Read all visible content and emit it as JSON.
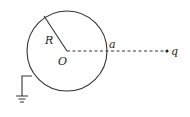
{
  "diagram": {
    "labels": {
      "radius": "R",
      "center": "O",
      "surface_point": "a",
      "charge": "q"
    },
    "colors": {
      "stroke": "#333333",
      "background": "#ffffff"
    },
    "elements": {
      "sphere": "grounded conducting sphere",
      "ground": "ground-symbol",
      "dashed_line": "line from center O through a to charge q"
    }
  }
}
